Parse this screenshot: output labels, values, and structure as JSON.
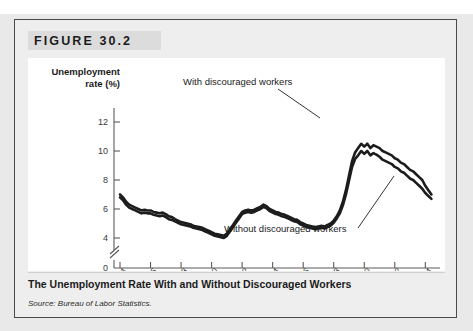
{
  "figure": {
    "header_label": "FIGURE 30.2",
    "caption": "The Unemployment Rate With and Without Discouraged Workers",
    "source": "Source: Bureau of Labor Statistics."
  },
  "colors": {
    "page_background": "#e9e9e9",
    "figure_background": "#eeeeee",
    "header_band": "#dcdcdc",
    "plot_background": "#ffffff",
    "line": "#1c1c1c",
    "axis": "#5a5a5a",
    "border": "#4a4a4a"
  },
  "chart_data": {
    "type": "line",
    "title": "The Unemployment Rate With and Without Discouraged Workers",
    "xlabel": "",
    "ylabel": "Unemployment rate (%)",
    "ylabel_lines": [
      "Unemployment",
      "rate (%)"
    ],
    "xlim": [
      1994,
      2014.7
    ],
    "ylim": [
      3.3,
      12.8
    ],
    "y_ticks": [
      4,
      6,
      8,
      10,
      12
    ],
    "y_zero_label": "0",
    "axis_break": true,
    "grid": false,
    "legend_position": "annotations-on-plot",
    "x_ticks": [
      1994,
      1996,
      1998,
      2000,
      2002,
      2004,
      2006,
      2008,
      2010,
      2012,
      2014
    ],
    "x_tick_labels": [
      "1994",
      "1996",
      "1998",
      "2000",
      "2002",
      "2004",
      "2006",
      "2008",
      "2010",
      "2012",
      "2014"
    ],
    "annotations": [
      {
        "text": "With discouraged workers",
        "target_x": 2009.8,
        "target_y": 10.5
      },
      {
        "text": "Without discouraged workers",
        "target_x": 2012.4,
        "target_y": 8.1
      }
    ],
    "series": [
      {
        "name": "With discouraged workers",
        "x": [
          1994.0,
          1994.2,
          1994.4,
          1994.6,
          1994.8,
          1995.0,
          1995.2,
          1995.4,
          1995.6,
          1995.8,
          1996.0,
          1996.2,
          1996.4,
          1996.6,
          1996.8,
          1997.0,
          1997.2,
          1997.4,
          1997.6,
          1997.8,
          1998.0,
          1998.2,
          1998.4,
          1998.6,
          1998.8,
          1999.0,
          1999.2,
          1999.4,
          1999.6,
          1999.8,
          2000.0,
          2000.2,
          2000.4,
          2000.6,
          2000.8,
          2001.0,
          2001.2,
          2001.4,
          2001.6,
          2001.8,
          2002.0,
          2002.2,
          2002.4,
          2002.6,
          2002.8,
          2003.0,
          2003.2,
          2003.4,
          2003.6,
          2003.8,
          2004.0,
          2004.2,
          2004.4,
          2004.6,
          2004.8,
          2005.0,
          2005.2,
          2005.4,
          2005.6,
          2005.8,
          2006.0,
          2006.2,
          2006.4,
          2006.6,
          2006.8,
          2007.0,
          2007.2,
          2007.4,
          2007.6,
          2007.8,
          2008.0,
          2008.2,
          2008.4,
          2008.6,
          2008.8,
          2009.0,
          2009.2,
          2009.4,
          2009.6,
          2009.8,
          2010.0,
          2010.2,
          2010.4,
          2010.6,
          2010.8,
          2011.0,
          2011.2,
          2011.4,
          2011.6,
          2011.8,
          2012.0,
          2012.2,
          2012.4,
          2012.6,
          2012.8,
          2013.0,
          2013.2,
          2013.4,
          2013.6,
          2013.8,
          2014.0,
          2014.2,
          2014.4
        ],
        "y": [
          7.0,
          6.8,
          6.5,
          6.3,
          6.2,
          6.1,
          6.0,
          5.9,
          5.95,
          5.9,
          5.9,
          5.8,
          5.75,
          5.7,
          5.75,
          5.65,
          5.5,
          5.45,
          5.3,
          5.2,
          5.1,
          5.05,
          5.0,
          4.95,
          4.85,
          4.8,
          4.75,
          4.7,
          4.6,
          4.5,
          4.4,
          4.3,
          4.25,
          4.2,
          4.15,
          4.3,
          4.6,
          4.9,
          5.2,
          5.5,
          5.8,
          5.9,
          5.95,
          5.9,
          5.95,
          6.05,
          6.15,
          6.3,
          6.2,
          6.0,
          5.9,
          5.8,
          5.75,
          5.65,
          5.6,
          5.5,
          5.4,
          5.3,
          5.25,
          5.1,
          5.0,
          4.9,
          4.85,
          4.8,
          4.75,
          4.8,
          4.85,
          4.8,
          4.9,
          5.0,
          5.2,
          5.5,
          5.9,
          6.5,
          7.3,
          8.3,
          9.3,
          9.9,
          10.2,
          10.5,
          10.3,
          10.5,
          10.2,
          10.4,
          10.3,
          10.2,
          10.0,
          9.9,
          9.8,
          9.7,
          9.5,
          9.4,
          9.2,
          9.1,
          8.9,
          8.7,
          8.6,
          8.4,
          8.2,
          8.0,
          7.6,
          7.3,
          7.0
        ]
      },
      {
        "name": "Without discouraged workers",
        "x": [
          1994.0,
          1994.2,
          1994.4,
          1994.6,
          1994.8,
          1995.0,
          1995.2,
          1995.4,
          1995.6,
          1995.8,
          1996.0,
          1996.2,
          1996.4,
          1996.6,
          1996.8,
          1997.0,
          1997.2,
          1997.4,
          1997.6,
          1997.8,
          1998.0,
          1998.2,
          1998.4,
          1998.6,
          1998.8,
          1999.0,
          1999.2,
          1999.4,
          1999.6,
          1999.8,
          2000.0,
          2000.2,
          2000.4,
          2000.6,
          2000.8,
          2001.0,
          2001.2,
          2001.4,
          2001.6,
          2001.8,
          2002.0,
          2002.2,
          2002.4,
          2002.6,
          2002.8,
          2003.0,
          2003.2,
          2003.4,
          2003.6,
          2003.8,
          2004.0,
          2004.2,
          2004.4,
          2004.6,
          2004.8,
          2005.0,
          2005.2,
          2005.4,
          2005.6,
          2005.8,
          2006.0,
          2006.2,
          2006.4,
          2006.6,
          2006.8,
          2007.0,
          2007.2,
          2007.4,
          2007.6,
          2007.8,
          2008.0,
          2008.2,
          2008.4,
          2008.6,
          2008.8,
          2009.0,
          2009.2,
          2009.4,
          2009.6,
          2009.8,
          2010.0,
          2010.2,
          2010.4,
          2010.6,
          2010.8,
          2011.0,
          2011.2,
          2011.4,
          2011.6,
          2011.8,
          2012.0,
          2012.2,
          2012.4,
          2012.6,
          2012.8,
          2013.0,
          2013.2,
          2013.4,
          2013.6,
          2013.8,
          2014.0,
          2014.2,
          2014.4
        ],
        "y": [
          6.8,
          6.6,
          6.3,
          6.1,
          6.0,
          5.9,
          5.8,
          5.7,
          5.75,
          5.7,
          5.7,
          5.6,
          5.55,
          5.5,
          5.55,
          5.45,
          5.3,
          5.25,
          5.15,
          5.05,
          4.95,
          4.9,
          4.85,
          4.8,
          4.7,
          4.65,
          4.6,
          4.55,
          4.45,
          4.35,
          4.25,
          4.15,
          4.1,
          4.05,
          4.0,
          4.15,
          4.45,
          4.75,
          5.05,
          5.35,
          5.65,
          5.75,
          5.8,
          5.75,
          5.8,
          5.9,
          6.0,
          6.15,
          6.05,
          5.85,
          5.75,
          5.65,
          5.6,
          5.5,
          5.45,
          5.35,
          5.25,
          5.15,
          5.1,
          4.95,
          4.85,
          4.75,
          4.7,
          4.65,
          4.6,
          4.65,
          4.7,
          4.65,
          4.75,
          4.85,
          5.05,
          5.35,
          5.7,
          6.25,
          7.0,
          7.95,
          8.9,
          9.45,
          9.7,
          10.0,
          9.8,
          10.0,
          9.7,
          9.85,
          9.75,
          9.6,
          9.4,
          9.3,
          9.2,
          9.1,
          8.9,
          8.8,
          8.6,
          8.5,
          8.3,
          8.1,
          8.0,
          7.8,
          7.6,
          7.4,
          7.1,
          6.9,
          6.7
        ]
      }
    ]
  }
}
